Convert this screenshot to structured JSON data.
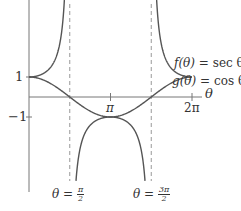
{
  "chart_data": {
    "type": "line",
    "title": "",
    "xlabel": "θ",
    "ylabel": "",
    "xlim": [
      0,
      6.2832
    ],
    "ylim": [
      -1,
      1
    ],
    "grid": false,
    "x_ticks": [
      {
        "value": 3.1416,
        "label": "π"
      },
      {
        "value": 6.2832,
        "label": "2π"
      }
    ],
    "y_ticks": [
      {
        "value": 1,
        "label": "1"
      },
      {
        "value": -1,
        "label": "−1"
      }
    ],
    "series": [
      {
        "name": "f(θ) = sec θ",
        "function": "sec",
        "color": "#555555"
      },
      {
        "name": "g(θ) = cos θ",
        "function": "cos",
        "color": "#555555"
      }
    ],
    "asymptotes": [
      {
        "x": 1.5708,
        "label_lhs": "θ =",
        "label_num": "π",
        "label_den": "2",
        "style": "dashed"
      },
      {
        "x": 4.7124,
        "label_lhs": "θ =",
        "label_num": "3π",
        "label_den": "2",
        "style": "dashed"
      }
    ],
    "annotations": [
      {
        "text_fn": "f(θ)",
        "text_eq": "= sec θ"
      },
      {
        "text_fn": "g(θ)",
        "text_eq": "= cos θ"
      }
    ]
  }
}
